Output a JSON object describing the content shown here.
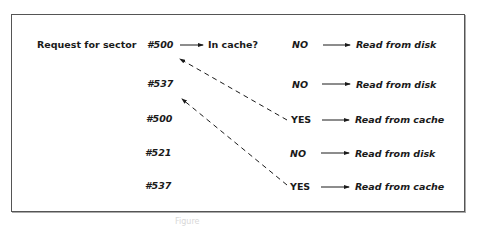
{
  "diagram": {
    "title_label": "Request for sector",
    "decision_label": "In cache?",
    "rows": [
      {
        "sector": "#500",
        "result": "NO",
        "action": "Read from disk"
      },
      {
        "sector": "#537",
        "result": "NO",
        "action": "Read from disk"
      },
      {
        "sector": "#500",
        "result": "YES",
        "action": "Read from cache"
      },
      {
        "sector": "#521",
        "result": "NO",
        "action": "Read from disk"
      },
      {
        "sector": "#537",
        "result": "YES",
        "action": "Read from cache"
      }
    ],
    "cache_hit_links": [
      {
        "from_row": 2,
        "to_row": 0,
        "style": "dashed"
      },
      {
        "from_row": 4,
        "to_row": 1,
        "style": "dashed"
      }
    ],
    "caption": "Figure"
  },
  "colors": {
    "line": "#1a1a1a",
    "frame": "#555555",
    "background": "#ffffff"
  }
}
